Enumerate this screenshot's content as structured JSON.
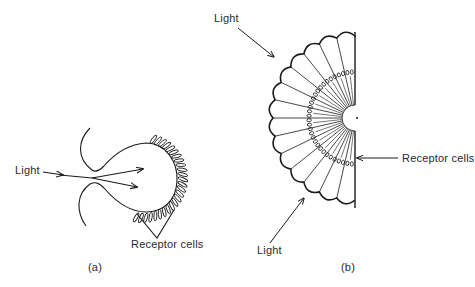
{
  "figure": {
    "stroke_color": "#1a1a1a",
    "background": "#ffffff",
    "panel_a": {
      "caption": "(a)",
      "type": "pinhole / cup eye",
      "light_label": "Light",
      "receptor_label": "Receptor cells",
      "receptor_count": 26
    },
    "panel_b": {
      "caption": "(b)",
      "type": "compound eye (half section)",
      "light_label_top": "Light",
      "light_label_bottom": "Light",
      "receptor_label": "Receptor cells",
      "ommatidia_count": 14
    }
  }
}
